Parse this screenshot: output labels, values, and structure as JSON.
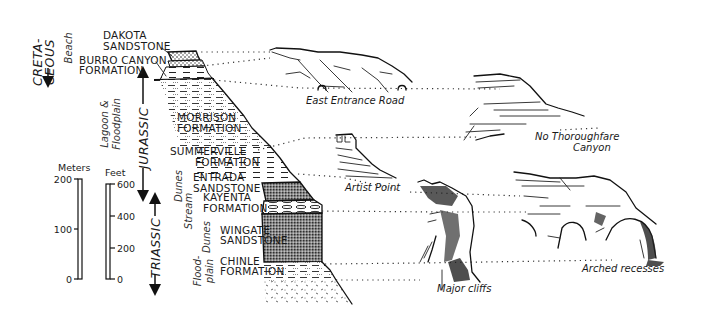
{
  "periods": [
    {
      "label": "CRETA-",
      "label2": "CEOUS"
    },
    {
      "label": "JURASSIC"
    },
    {
      "label": "TRIASSIC"
    }
  ],
  "environments": {
    "beach": "Beach",
    "lagoon_line1": "Lagoon &",
    "lagoon_line2": "Floodplain",
    "dunes_upper": "Dunes",
    "stream": "Stream",
    "dunes_lower": "Dunes",
    "flood_line1": "Flood-",
    "flood_line2": "plain"
  },
  "formations": [
    {
      "line1": "DAKOTA",
      "line2": "SANDSTONE"
    },
    {
      "line1": "BURRO CANYON",
      "line2": "FORMATION"
    },
    {
      "line1": "MORRISON",
      "line2": "FORMATION"
    },
    {
      "line1": "SUMMERVILLE",
      "line2": "FORMATION"
    },
    {
      "line1": "ENTRADA",
      "line2": "SANDSTONE"
    },
    {
      "line1": "KAYENTA",
      "line2": "FORMATION"
    },
    {
      "line1": "WINGATE",
      "line2": "SANDSTONE"
    },
    {
      "line1": "CHINLE",
      "line2": "FORMATION"
    }
  ],
  "scales": {
    "meters": {
      "title": "Meters",
      "ticks": [
        "200",
        "100",
        "0"
      ]
    },
    "feet": {
      "title": "Feet",
      "ticks": [
        "600",
        "400",
        "200",
        "0"
      ]
    }
  },
  "landscapes": {
    "east_entrance": "East Entrance Road",
    "no_thoroughfare_line1": "No Thoroughfare",
    "no_thoroughfare_line2": "Canyon",
    "artist_point": "Artist Point",
    "major_cliffs": "Major cliffs",
    "arched_recesses": "Arched recesses"
  }
}
